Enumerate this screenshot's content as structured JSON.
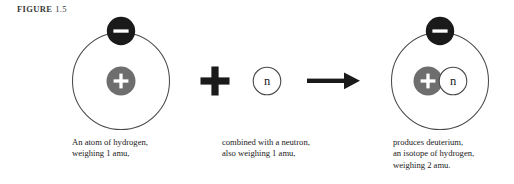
{
  "figure": {
    "label_word": "FIGURE",
    "label_number": "1.5"
  },
  "colors": {
    "background": "#ffffff",
    "electron_fill": "#1a1a1a",
    "electron_symbol": "#ffffff",
    "proton_fill": "#6e6e6e",
    "proton_symbol": "#ffffff",
    "neutron_fill": "#ffffff",
    "neutron_stroke": "#4a4a4a",
    "neutron_symbol": "#1a1a1a",
    "orbit_stroke": "#4a4a4a",
    "operator": "#1a1a1a",
    "text": "#1a1a1a"
  },
  "particles": {
    "electron_symbol": "−",
    "proton_symbol": "+",
    "neutron_symbol": "n"
  },
  "operators": {
    "plus": "+",
    "arrow": "→"
  },
  "panels": [
    {
      "id": "hydrogen-atom",
      "name": "An atom of hydrogen",
      "caption_lines": [
        "An atom of hydrogen,",
        "weighing 1 amu,"
      ],
      "nucleus": [
        "proton"
      ],
      "electrons": 1,
      "mass_amu": 1
    },
    {
      "id": "free-neutron",
      "name": "A free neutron",
      "caption_lines": [
        "combined with a neutron,",
        "also weighing 1 amu,"
      ],
      "nucleus": [
        "neutron"
      ],
      "electrons": 0,
      "mass_amu": 1
    },
    {
      "id": "deuterium-atom",
      "name": "Deuterium, an isotope of hydrogen",
      "caption_lines": [
        "produces deuterium,",
        "an isotope of hydrogen,",
        "weighing 2 amu."
      ],
      "nucleus": [
        "proton",
        "neutron"
      ],
      "electrons": 1,
      "mass_amu": 2
    }
  ]
}
